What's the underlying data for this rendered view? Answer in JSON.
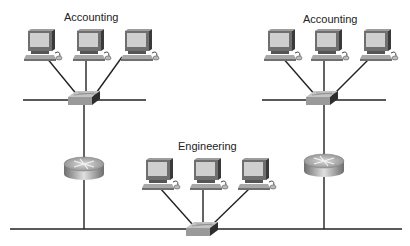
{
  "diagram": {
    "type": "network-topology",
    "groups": [
      {
        "id": "acct-left",
        "label": "Accounting",
        "pcs": 3,
        "device": "switch"
      },
      {
        "id": "acct-right",
        "label": "Accounting",
        "pcs": 3,
        "device": "switch"
      },
      {
        "id": "engineering",
        "label": "Engineering",
        "pcs": 3,
        "device": "switch"
      }
    ],
    "routers": 2,
    "colors": {
      "line": "#222222",
      "device_gray": "#9a9a9a",
      "screen": "#c8c8c8"
    }
  }
}
